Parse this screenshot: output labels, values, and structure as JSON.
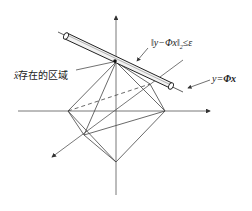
{
  "diagram": {
    "title": "",
    "labels": {
      "constraint_norm": "‖y−Φx‖",
      "constraint_sub": "2",
      "constraint_rel": "≤ε",
      "feasible_region_symbol": "x̂",
      "feasible_region_text": "存在的区域",
      "line_equation_lhs": "y=",
      "line_equation_rhs": "Φx"
    },
    "elements": {
      "axes": [
        "vertical-axis",
        "horizontal-axis",
        "depth-axis"
      ],
      "shape": "l1-ball-octahedron",
      "tube": "noise-tube-around-line",
      "line": "y=Φx"
    },
    "colors": {
      "stroke": "#333333",
      "background": "#ffffff"
    }
  }
}
